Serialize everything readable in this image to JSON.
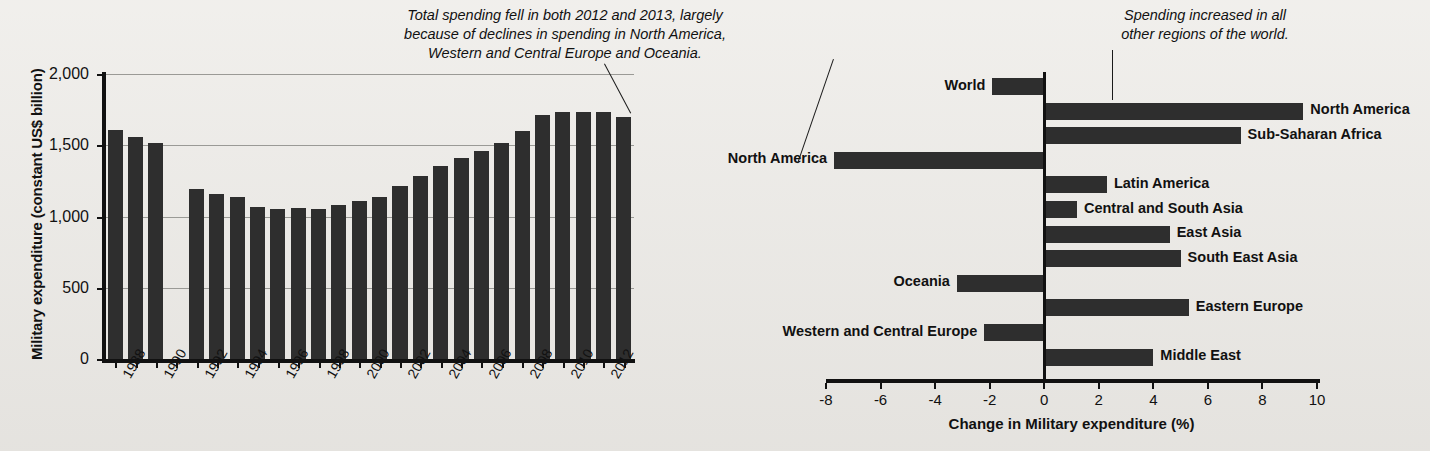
{
  "annotations": [
    {
      "id": "left-note",
      "text": "Total spending fell in both 2012 and 2013, largely\nbecause of declines in spending in North America,\nWestern and Central Europe and Oceania."
    },
    {
      "id": "right-note",
      "text": "Spending increased in all\nother regions of the world."
    }
  ],
  "colors": {
    "bar": "#2e2e2e",
    "axis": "#111111",
    "grid": "#9a9a96",
    "background": "#eceae6"
  },
  "chart_data": [
    {
      "id": "military-expenditure-timeseries",
      "type": "bar",
      "title": "",
      "xlabel": "",
      "ylabel": "Military expenditure (constant US$ billion)",
      "ylim": [
        0,
        2000
      ],
      "yticks": [
        0,
        500,
        1000,
        1500,
        2000
      ],
      "ytick_labels": [
        "0",
        "500",
        "1,000",
        "1,500",
        "2,000"
      ],
      "grid": true,
      "legend": "none",
      "xtick_labels": [
        "1988",
        "1990",
        "1992",
        "1994",
        "1996",
        "1998",
        "2000",
        "2002",
        "2004",
        "2006",
        "2008",
        "2010",
        "2012"
      ],
      "categories": [
        "1988",
        "1989",
        "1990",
        "1991",
        "1992",
        "1993",
        "1994",
        "1995",
        "1996",
        "1997",
        "1998",
        "1999",
        "2000",
        "2001",
        "2002",
        "2003",
        "2004",
        "2005",
        "2006",
        "2007",
        "2008",
        "2009",
        "2010",
        "2011",
        "2012",
        "2013"
      ],
      "values": [
        1610,
        1555,
        1515,
        null,
        1195,
        1160,
        1135,
        1070,
        1055,
        1060,
        1055,
        1080,
        1110,
        1140,
        1215,
        1285,
        1355,
        1410,
        1460,
        1515,
        1600,
        1710,
        1730,
        1730,
        1730,
        1700
      ]
    },
    {
      "id": "change-in-military-expenditure",
      "type": "bar",
      "orientation": "horizontal",
      "title": "",
      "xlabel": "Change in Military expenditure (%)",
      "ylabel": "",
      "xlim": [
        -8,
        10
      ],
      "xticks": [
        -8,
        -6,
        -4,
        -2,
        0,
        2,
        4,
        6,
        8,
        10
      ],
      "xtick_labels": [
        "-8",
        "-6",
        "-4",
        "-2",
        "0",
        "2",
        "4",
        "6",
        "8",
        "10"
      ],
      "grid": false,
      "legend": "none",
      "categories": [
        "World",
        "North America",
        "Sub-Saharan Africa",
        "North America",
        "Latin America",
        "Central and South Asia",
        "East Asia",
        "South East Asia",
        "Oceania",
        "Eastern Europe",
        "Western and Central Europe",
        "Middle East"
      ],
      "values": [
        -1.9,
        9.5,
        7.2,
        -7.7,
        2.3,
        1.2,
        4.6,
        5.0,
        -3.2,
        5.3,
        -2.2,
        4.0
      ]
    }
  ]
}
